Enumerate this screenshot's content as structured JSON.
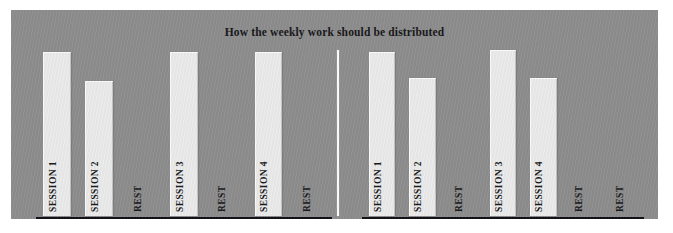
{
  "figure": {
    "title": "How the weekly work should be distributed",
    "background_color": "#8d8d8d",
    "bar_color": "#ebebeb",
    "axis_color": "#101014",
    "divider_color": "#fdfdfd",
    "text_color": "#17171a"
  },
  "chart_data": {
    "type": "bar",
    "title": "How the weekly work should be distributed",
    "xlabel": "",
    "ylabel": "",
    "ylim": [
      0,
      100
    ],
    "grid": false,
    "legend": "none",
    "panels": [
      {
        "name": "option-a",
        "categories": [
          "SESSION 1",
          "SESSION 2",
          "REST",
          "SESSION 3",
          "REST",
          "SESSION 4",
          "REST"
        ],
        "values": [
          100,
          82,
          0,
          100,
          0,
          100,
          0
        ]
      },
      {
        "name": "option-b",
        "categories": [
          "SESSION 1",
          "SESSION 2",
          "REST",
          "SESSION 3",
          "SESSION 4",
          "REST",
          "REST"
        ],
        "values": [
          100,
          84,
          0,
          101,
          84,
          0,
          0
        ]
      }
    ]
  },
  "panel_left": {
    "slots": [
      {
        "label": "SESSION 1",
        "value": 100,
        "has_bar": true
      },
      {
        "label": "SESSION 2",
        "value": 82,
        "has_bar": true
      },
      {
        "label": "REST",
        "value": 0,
        "has_bar": false
      },
      {
        "label": "SESSION 3",
        "value": 100,
        "has_bar": true
      },
      {
        "label": "REST",
        "value": 0,
        "has_bar": false
      },
      {
        "label": "SESSION 4",
        "value": 100,
        "has_bar": true
      },
      {
        "label": "REST",
        "value": 0,
        "has_bar": false
      }
    ]
  },
  "panel_right": {
    "slots": [
      {
        "label": "SESSION 1",
        "value": 100,
        "has_bar": true
      },
      {
        "label": "SESSION 2",
        "value": 84,
        "has_bar": true
      },
      {
        "label": "REST",
        "value": 0,
        "has_bar": false
      },
      {
        "label": "SESSION 3",
        "value": 101,
        "has_bar": true
      },
      {
        "label": "SESSION 4",
        "value": 84,
        "has_bar": true
      },
      {
        "label": "REST",
        "value": 0,
        "has_bar": false
      },
      {
        "label": "REST",
        "value": 0,
        "has_bar": false
      }
    ]
  }
}
